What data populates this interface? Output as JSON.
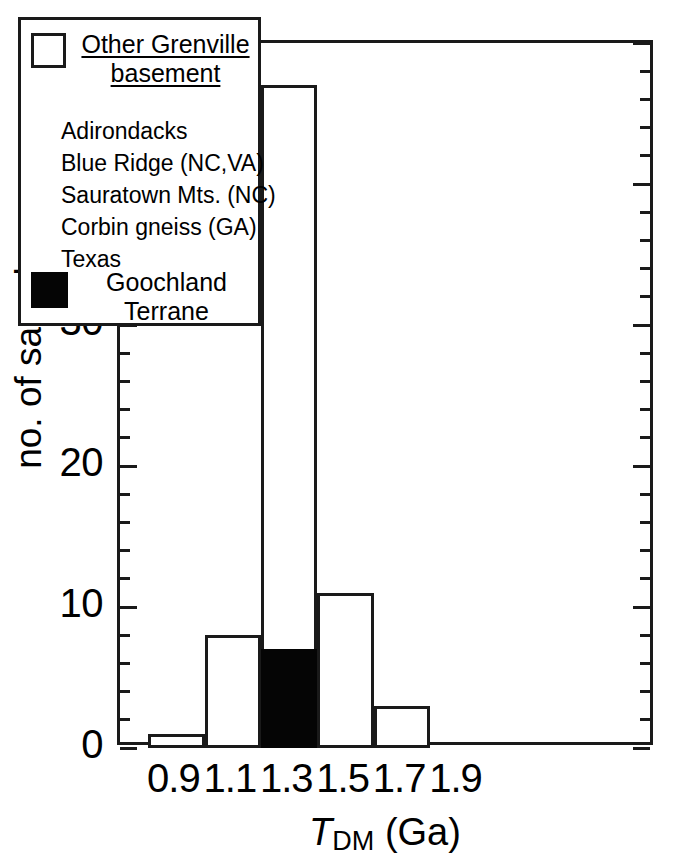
{
  "chart_data": {
    "type": "bar",
    "title": "",
    "subtitle": "",
    "xlabel": "T_DM (Ga)",
    "xlabel_parts": {
      "symbol": "T",
      "subscript": "DM",
      "unit": "(Ga)"
    },
    "ylabel": "no. of samples",
    "xlim": [
      0.7,
      2.6
    ],
    "ylim": [
      0,
      50
    ],
    "grid": false,
    "legend_position": "top-left-inside",
    "x_tick_labels": [
      "0.9",
      "1.1",
      "1.3",
      "1.5",
      "1.7",
      "1.9"
    ],
    "x_tick_values": [
      0.9,
      1.1,
      1.3,
      1.5,
      1.7,
      1.9
    ],
    "y_tick_labels": [
      "0",
      "10",
      "20",
      "30",
      "40",
      "50"
    ],
    "y_tick_values": [
      0,
      10,
      20,
      30,
      40,
      50
    ],
    "y_minor_tick_interval": 2,
    "bin_width": 0.2,
    "categories": [
      "0.9",
      "1.1",
      "1.3",
      "1.5",
      "1.7"
    ],
    "bin_ranges": [
      [
        0.8,
        1.0
      ],
      [
        1.0,
        1.2
      ],
      [
        1.2,
        1.4
      ],
      [
        1.4,
        1.6
      ],
      [
        1.6,
        1.8
      ]
    ],
    "series": [
      {
        "name": "Other Grenville basement",
        "color": "#ffffff",
        "edge_color": "#1a1a1a",
        "values": [
          1,
          8,
          47,
          11,
          3
        ]
      },
      {
        "name": "Goochland Terrane",
        "color": "#050505",
        "edge_color": "#050505",
        "values": [
          0,
          0,
          7,
          0,
          0
        ]
      }
    ]
  },
  "axes": {
    "y_title": "no. of samples",
    "y_ticks": [
      {
        "label": "50",
        "value": 50,
        "major": true
      },
      {
        "label": "",
        "value": 48,
        "major": false
      },
      {
        "label": "",
        "value": 46,
        "major": false
      },
      {
        "label": "",
        "value": 44,
        "major": false
      },
      {
        "label": "",
        "value": 42,
        "major": false
      },
      {
        "label": "40",
        "value": 40,
        "major": true
      },
      {
        "label": "",
        "value": 38,
        "major": false
      },
      {
        "label": "",
        "value": 36,
        "major": false
      },
      {
        "label": "",
        "value": 34,
        "major": false
      },
      {
        "label": "",
        "value": 32,
        "major": false
      },
      {
        "label": "30",
        "value": 30,
        "major": true
      },
      {
        "label": "",
        "value": 28,
        "major": false
      },
      {
        "label": "",
        "value": 26,
        "major": false
      },
      {
        "label": "",
        "value": 24,
        "major": false
      },
      {
        "label": "",
        "value": 22,
        "major": false
      },
      {
        "label": "20",
        "value": 20,
        "major": true
      },
      {
        "label": "",
        "value": 18,
        "major": false
      },
      {
        "label": "",
        "value": 16,
        "major": false
      },
      {
        "label": "",
        "value": 14,
        "major": false
      },
      {
        "label": "",
        "value": 12,
        "major": false
      },
      {
        "label": "10",
        "value": 10,
        "major": true
      },
      {
        "label": "",
        "value": 8,
        "major": false
      },
      {
        "label": "",
        "value": 6,
        "major": false
      },
      {
        "label": "",
        "value": 4,
        "major": false
      },
      {
        "label": "",
        "value": 2,
        "major": false
      },
      {
        "label": "0",
        "value": 0,
        "major": true
      }
    ],
    "x_ticks": [
      {
        "label": "0.9",
        "value": 0.9
      },
      {
        "label": "1.1",
        "value": 1.1
      },
      {
        "label": "1.3",
        "value": 1.3
      },
      {
        "label": "1.5",
        "value": 1.5
      },
      {
        "label": "1.7",
        "value": 1.7
      },
      {
        "label": "1.9",
        "value": 1.9
      }
    ]
  },
  "legend": {
    "header": {
      "swatch": "open-square",
      "line1": "Other Grenville",
      "line2": "basement",
      "text": "Other Grenville basement"
    },
    "items": [
      {
        "label": "Adirondacks"
      },
      {
        "label": "Blue Ridge (NC,VA)"
      },
      {
        "label": "Sauratown Mts. (NC)"
      },
      {
        "label": "Corbin gneiss (GA)"
      },
      {
        "label": "Texas"
      }
    ],
    "footer": {
      "swatch": "filled-square",
      "line1": "Goochland",
      "line2": "Terrane",
      "text": "Goochland Terrane"
    }
  },
  "colors": {
    "ink": "#1a1a1a",
    "fill_black": "#050505",
    "background": "#ffffff"
  }
}
